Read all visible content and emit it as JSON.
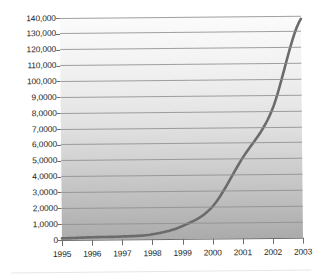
{
  "chart_data": {
    "type": "line",
    "title": "",
    "subtitle": "",
    "xlabel": "",
    "ylabel": "",
    "grid": true,
    "legend": false,
    "x": [
      1995,
      1996,
      1997,
      1998,
      1999,
      2000,
      2001,
      2002,
      2003
    ],
    "categories": [
      "1995",
      "1996",
      "1997",
      "1998",
      "1999",
      "2000",
      "2001",
      "2002",
      "2003"
    ],
    "values": [
      1000,
      1500,
      1800,
      3000,
      8000,
      20000,
      50000,
      80000,
      138000
    ],
    "series": [
      {
        "name": "series-1",
        "color": "#6b6b6b",
        "values": [
          1000,
          1500,
          1800,
          3000,
          8000,
          20000,
          50000,
          80000,
          138000
        ]
      }
    ],
    "xlim": [
      1995,
      2003
    ],
    "ylim": [
      0,
      140000
    ],
    "ytick_values": [
      0,
      10000,
      20000,
      30000,
      40000,
      50000,
      60000,
      70000,
      80000,
      90000,
      100000,
      110000,
      120000,
      130000,
      140000
    ],
    "ytick_labels": [
      "0",
      "1,0000",
      "2,0000",
      "3,0000",
      "4,0000",
      "5,0000",
      "6,0000",
      "7,0000",
      "8,0000",
      "9,0000",
      "100,000",
      "110,000",
      "120,000",
      "130,000",
      "140,000"
    ],
    "xtick_labels": [
      "1995",
      "1996",
      "1997",
      "1998",
      "1999",
      "2000",
      "2001",
      "2002",
      "2003"
    ],
    "colors": {
      "line": "#6b6b6b",
      "gridline": "#8f8f8f",
      "axis": "#6d6d6d",
      "text": "#1d1d1d",
      "plot_top": "#fbfbfb",
      "plot_bottom": "#ababab",
      "background": "#ffffff"
    }
  }
}
